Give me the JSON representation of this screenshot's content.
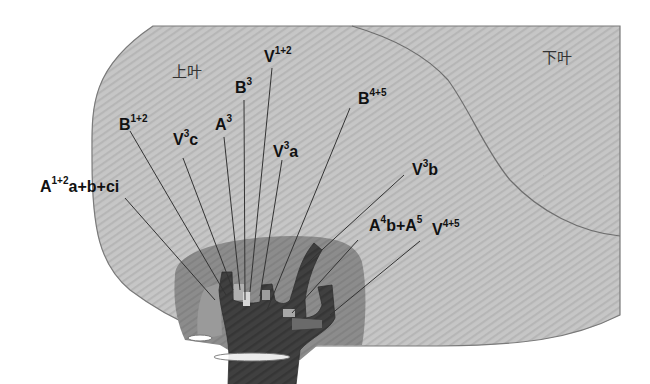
{
  "diagram": {
    "type": "anatomical-illustration",
    "lobes": {
      "upper": "上叶",
      "lower": "下叶"
    },
    "labels": [
      {
        "id": "B1+2",
        "base": "B",
        "sup": "1+2",
        "rest": ""
      },
      {
        "id": "V3c",
        "base": "V",
        "sup": "3",
        "rest": "c"
      },
      {
        "id": "A3",
        "base": "A",
        "sup": "3",
        "rest": ""
      },
      {
        "id": "B3",
        "base": "B",
        "sup": "3",
        "rest": ""
      },
      {
        "id": "V1+2",
        "base": "V",
        "sup": "1+2",
        "rest": ""
      },
      {
        "id": "V3a",
        "base": "V",
        "sup": "3",
        "rest": "a"
      },
      {
        "id": "B4+5",
        "base": "B",
        "sup": "4+5",
        "rest": ""
      },
      {
        "id": "V3b",
        "base": "V",
        "sup": "3",
        "rest": "b"
      },
      {
        "id": "A1+2a+b+ci",
        "base": "A",
        "sup": "1+2",
        "rest": "a+b+ci"
      },
      {
        "id": "A4b+A5",
        "base": "A",
        "sup": "4",
        "rest": "b+A",
        "sup2": "5"
      },
      {
        "id": "V4+5",
        "base": "V",
        "sup": "4+5",
        "rest": ""
      }
    ],
    "colors": {
      "lung": "#c4c4c4",
      "lung_stripe": "#b5b5b5",
      "outline": "#777777",
      "hilum_region": "#8a8a8a",
      "trunk": "#3d3d3d",
      "leader_line": "#333333"
    }
  }
}
